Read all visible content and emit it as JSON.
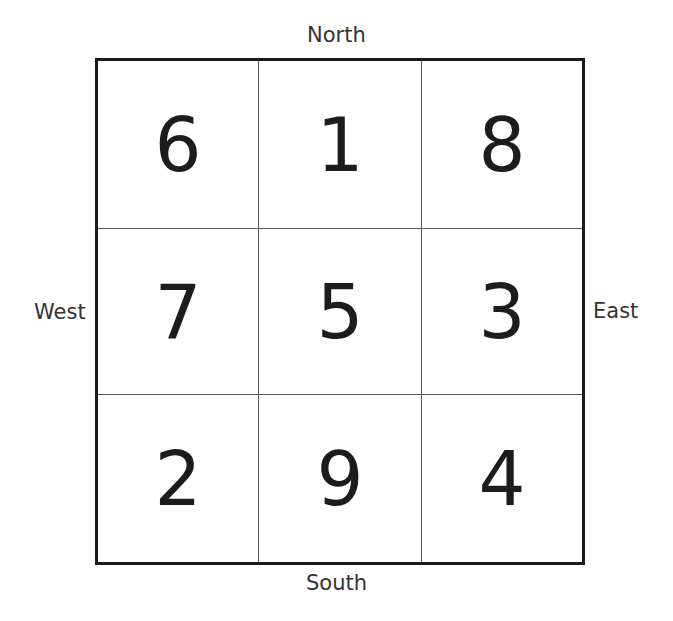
{
  "compass": {
    "north": "North",
    "south": "South",
    "west": "West",
    "east": "East"
  },
  "magic_square": {
    "rows": [
      [
        "6",
        "1",
        "8"
      ],
      [
        "7",
        "5",
        "3"
      ],
      [
        "2",
        "9",
        "4"
      ]
    ]
  },
  "colors": {
    "border": "#1a1a1a",
    "grid_lines": "#555555",
    "text": "#1c1c1c",
    "background": "#ffffff"
  }
}
